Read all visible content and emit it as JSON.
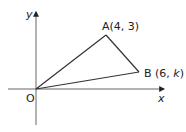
{
  "diagram": {
    "type": "coordinate-geometry-triangle",
    "axes": {
      "x_label": "x",
      "y_label": "y",
      "origin_label": "O"
    },
    "points": [
      {
        "name": "O",
        "label": "O"
      },
      {
        "name": "A",
        "label": "A(4, 3)",
        "x": 4,
        "y": 3
      },
      {
        "name": "B",
        "label_prefix": "B (6, ",
        "label_var": "k",
        "label_suffix": ")",
        "x": 6,
        "y": "k"
      }
    ],
    "segments": [
      "OA",
      "AB",
      "OB"
    ],
    "colors": {
      "line": "#333333",
      "text": "#222222",
      "axis": "#555555"
    }
  }
}
